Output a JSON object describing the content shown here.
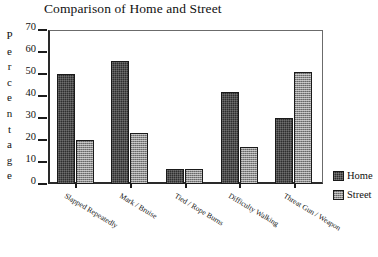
{
  "chart_data": {
    "type": "bar",
    "title": "Comparison of Home and Street",
    "xlabel": "",
    "ylabel": "Percentage",
    "ylim": [
      0,
      70
    ],
    "yticks": [
      0,
      10,
      20,
      30,
      40,
      50,
      60,
      70
    ],
    "grid": false,
    "legend_position": "right",
    "categories": [
      "Slapped Repeatedly",
      "Mark / Bruise",
      "Tied / Rope Burns",
      "Difficulty Walking",
      "Threat Gun / Weapon"
    ],
    "series": [
      {
        "name": "Home",
        "values": [
          50,
          56,
          7,
          42,
          30
        ],
        "color": "#2e2e2e"
      },
      {
        "name": "Street",
        "values": [
          20,
          23,
          7,
          17,
          51
        ],
        "color": "#8d8d8d"
      }
    ]
  },
  "ylabel_letters": [
    "P",
    "e",
    "r",
    "c",
    "e",
    "n",
    "t",
    "a",
    "g",
    "e"
  ]
}
